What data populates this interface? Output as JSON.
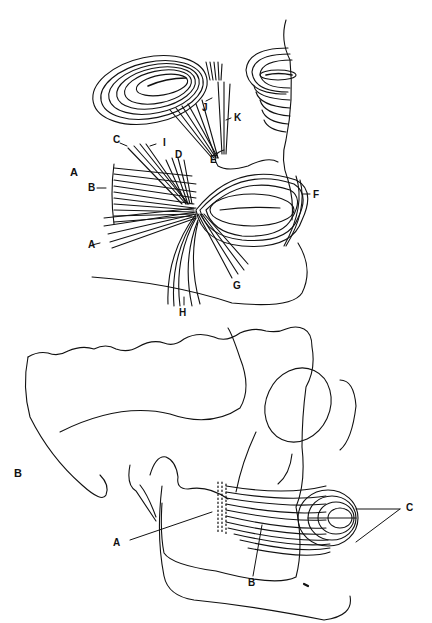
{
  "figure": {
    "panels": [
      {
        "id": "A",
        "label": "A",
        "description": "Facial muscles around mouth, nose and eyes (frontal oblique view)",
        "callouts": [
          "A",
          "B",
          "C",
          "D",
          "E",
          "F",
          "G",
          "H",
          "I",
          "J",
          "K"
        ]
      },
      {
        "id": "B",
        "label": "B",
        "description": "Lateral view of skull showing buccinator and orbicularis oris",
        "callouts": [
          "A",
          "B",
          "C"
        ]
      }
    ]
  },
  "labels": {
    "panelA": {
      "panel": "A",
      "A": "A",
      "B": "B",
      "C": "C",
      "D": "D",
      "E": "E",
      "F": "F",
      "G": "G",
      "H": "H",
      "I": "I",
      "J": "J",
      "K": "K"
    },
    "panelB": {
      "panel": "B",
      "A": "A",
      "B": "B",
      "C": "C"
    }
  },
  "colors": {
    "ink": "#111111",
    "background": "#ffffff"
  }
}
